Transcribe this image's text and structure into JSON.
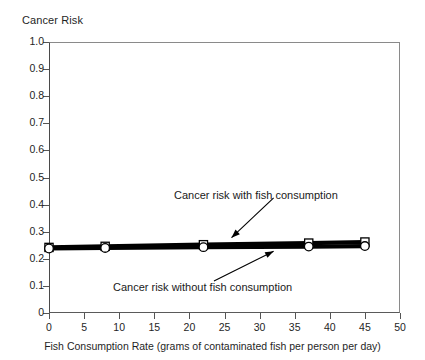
{
  "chart_data": {
    "type": "line",
    "title": "",
    "ylabel": "Cancer Risk",
    "xlabel": "Fish Consumption Rate (grams of contaminated fish per person per day)",
    "xlim": [
      0,
      50
    ],
    "ylim": [
      0,
      1.0
    ],
    "grid": true,
    "legend_position": "none",
    "x_ticks": [
      "0",
      "5",
      "10",
      "15",
      "20",
      "25",
      "30",
      "35",
      "40",
      "45",
      "50"
    ],
    "x_tick_values": [
      0,
      5,
      10,
      15,
      20,
      25,
      30,
      35,
      40,
      45,
      50
    ],
    "y_ticks": [
      "0",
      "0.1",
      "0.2",
      "0.3",
      "0.4",
      "0.5",
      "0.6",
      "0.7",
      "0.8",
      "0.9",
      "1.0"
    ],
    "y_tick_values": [
      0,
      0.1,
      0.2,
      0.3,
      0.4,
      0.5,
      0.6,
      0.7,
      0.8,
      0.9,
      1.0
    ],
    "x": [
      0,
      8,
      22,
      37,
      45
    ],
    "series": [
      {
        "name": "Cancer risk with fish consumption",
        "marker": "square",
        "values": [
          0.242,
          0.246,
          0.252,
          0.258,
          0.262
        ]
      },
      {
        "name": "Cancer risk without fish consumption",
        "marker": "circle",
        "values": [
          0.238,
          0.24,
          0.243,
          0.245,
          0.247
        ]
      }
    ],
    "annotations": [
      {
        "text": "Cancer risk with fish consumption",
        "arrow_from_x": 32.0,
        "arrow_from_y": 0.425,
        "arrow_to_x": 26.0,
        "arrow_to_y": 0.278
      },
      {
        "text": "Cancer risk without fish consumption",
        "arrow_from_x": 23.5,
        "arrow_from_y": 0.118,
        "arrow_to_x": 32.0,
        "arrow_to_y": 0.228
      }
    ]
  },
  "colors": {
    "series_line": "#000000",
    "marker_fill": "#ffffff",
    "marker_stroke": "#000000",
    "grid": "#b9b9b9",
    "axis": "#4a4a4a",
    "text": "#1a1a1a",
    "background": "#ffffff"
  }
}
